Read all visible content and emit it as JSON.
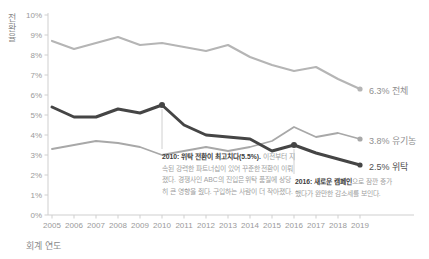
{
  "chart_data": {
    "type": "line",
    "title": "",
    "xlabel": "회계 연도",
    "ylabel": "전환율",
    "x": [
      2005,
      2006,
      2007,
      2008,
      2009,
      2010,
      2011,
      2012,
      2013,
      2014,
      2015,
      2016,
      2017,
      2018,
      2019
    ],
    "ylim": [
      0,
      10
    ],
    "ytick_step": 1,
    "ytick_suffix": "%",
    "grid": "off",
    "legend_position": "right-end-labels",
    "series": [
      {
        "name": "전체",
        "values": [
          8.7,
          8.3,
          8.6,
          8.9,
          8.5,
          8.6,
          8.4,
          8.2,
          8.5,
          7.9,
          7.5,
          7.2,
          7.4,
          6.8,
          6.3
        ],
        "color": "#b5b5b5",
        "end_label": "6.3% 전체"
      },
      {
        "name": "유기농",
        "values": [
          3.3,
          3.5,
          3.7,
          3.6,
          3.4,
          3.0,
          3.2,
          3.4,
          3.2,
          3.4,
          3.7,
          4.4,
          3.9,
          4.1,
          3.8
        ],
        "color": "#a8a8a8",
        "end_label": "3.8% 유기농"
      },
      {
        "name": "위탁",
        "values": [
          5.4,
          4.9,
          4.9,
          5.3,
          5.1,
          5.5,
          4.5,
          4.0,
          3.9,
          3.8,
          3.2,
          3.5,
          3.1,
          2.8,
          2.5
        ],
        "color": "#454545",
        "end_label": "2.5% 위탁",
        "markers": [
          {
            "year": 2010,
            "value": 5.5
          },
          {
            "year": 2016,
            "value": 3.5
          }
        ]
      }
    ],
    "annotations": [
      {
        "year": 2010,
        "value": 5.5,
        "bold": "2010: 위탁 전환이 최고치다(5.5%).",
        "text": "이전부터 지속된 강력한 파트너십이 있어 꾸준한 전환이 이뤄졌다. 경쟁사인 ABC의 진입은 위탁 품질에 상당히 큰 영향을 줬다. 구입하는 사람이 더 작아졌다."
      },
      {
        "year": 2016,
        "value": 3.5,
        "bold": "2016: 새로운 캠페인",
        "text": "으로 잠깐 증가했다가 완만한 감소세를 보인다."
      }
    ]
  }
}
